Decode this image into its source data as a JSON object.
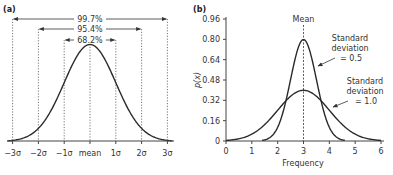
{
  "chart_data": [
    {
      "panel": "(a)",
      "type": "line",
      "title": "",
      "description": "Standard normal distribution with sigma intervals",
      "xlabel": "",
      "ylabel": "",
      "x_ticks": [
        "−3σ",
        "−2σ",
        "−1σ",
        "mean",
        "1σ",
        "2σ",
        "3σ"
      ],
      "x_tick_values": [
        -3,
        -2,
        -1,
        0,
        1,
        2,
        3
      ],
      "xlim": [
        -3.25,
        3.25
      ],
      "grid": false,
      "intervals": [
        {
          "label": "99.7%",
          "from": -3,
          "to": 3
        },
        {
          "label": "95.4%",
          "from": -2,
          "to": 2
        },
        {
          "label": "68.2%",
          "from": -1,
          "to": 1
        }
      ],
      "series": [
        {
          "name": "normal",
          "mean": 0,
          "sd": 1
        }
      ]
    },
    {
      "panel": "(b)",
      "type": "line",
      "title": "",
      "xlabel": "Frequency",
      "ylabel": "p(x)",
      "xlim": [
        0,
        6
      ],
      "ylim": [
        0,
        0.96
      ],
      "x_ticks": [
        0,
        1,
        2,
        3,
        4,
        5,
        6
      ],
      "y_ticks": [
        "0",
        "0.16",
        "0.32",
        "0.48",
        "0.64",
        "0.80",
        "0.96"
      ],
      "y_tick_values": [
        0,
        0.16,
        0.32,
        0.48,
        0.64,
        0.8,
        0.96
      ],
      "grid": false,
      "mean_line": {
        "label": "Mean",
        "x": 3
      },
      "series": [
        {
          "name": "Standard deviation = 0.5",
          "mean": 3,
          "sd": 0.5,
          "peak": 0.8
        },
        {
          "name": "Standard deviation = 1.0",
          "mean": 3,
          "sd": 1.0,
          "peak": 0.4
        }
      ],
      "annotations": [
        {
          "lines": [
            "Standard",
            "deviation",
            "= 0.5"
          ]
        },
        {
          "lines": [
            "Standard",
            "deviation",
            "= 1.0"
          ]
        }
      ]
    }
  ],
  "panels": {
    "a": {
      "label": "(a)"
    },
    "b": {
      "label": "(b)"
    }
  }
}
